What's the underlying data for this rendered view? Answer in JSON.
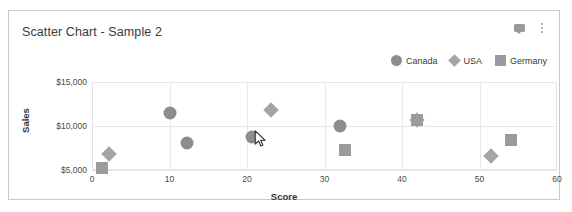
{
  "card": {
    "title": "Scatter Chart - Sample 2",
    "icons": [
      {
        "name": "comment-icon",
        "glyph": "speech-bubble"
      },
      {
        "name": "more-options-icon",
        "glyph": "kebab-menu"
      }
    ]
  },
  "colors": {
    "card_border": "#c9c9c9",
    "title_text": "#3a3a3a",
    "gridline": "#e8e8e8",
    "plot_border": "#e2e2e2",
    "canada_marker": "#8d8d8d",
    "usa_marker": "#a5a5a5",
    "germany_marker": "#9b9b9b",
    "axis_text": "#4a4a4a"
  },
  "chart_data": {
    "type": "scatter",
    "title": "Scatter Chart - Sample 2",
    "xlabel": "Score",
    "ylabel": "Sales",
    "xlim": [
      0,
      60
    ],
    "ylim": [
      3000,
      15800
    ],
    "grid": true,
    "legend_position": "top-right",
    "xticks": [
      "0",
      "10",
      "20",
      "30",
      "40",
      "50",
      "60"
    ],
    "xtick_values": [
      0,
      10,
      20,
      30,
      40,
      50,
      60
    ],
    "yticks": [
      "$5,000",
      "$10,000",
      "$15,000"
    ],
    "ytick_values": [
      5000,
      10000,
      15000
    ],
    "series": [
      {
        "name": "Canada",
        "marker": "circle",
        "color": "#8d8d8d",
        "points": [
          {
            "x": 10.0,
            "y": 11500
          },
          {
            "x": 12.2,
            "y": 8050
          },
          {
            "x": 20.6,
            "y": 8700
          },
          {
            "x": 32.0,
            "y": 10000
          }
        ]
      },
      {
        "name": "USA",
        "marker": "diamond",
        "color": "#a5a5a5",
        "points": [
          {
            "x": 2.2,
            "y": 6800
          },
          {
            "x": 23.1,
            "y": 11800
          },
          {
            "x": 41.9,
            "y": 10700
          },
          {
            "x": 51.5,
            "y": 6550
          }
        ]
      },
      {
        "name": "Germany",
        "marker": "square",
        "color": "#9b9b9b",
        "points": [
          {
            "x": 1.3,
            "y": 5250
          },
          {
            "x": 32.6,
            "y": 7300
          },
          {
            "x": 41.9,
            "y": 10700
          },
          {
            "x": 54.0,
            "y": 8400
          }
        ]
      }
    ]
  },
  "cursor": {
    "name": "mouse-pointer",
    "x": 22.1,
    "y": 8300
  }
}
